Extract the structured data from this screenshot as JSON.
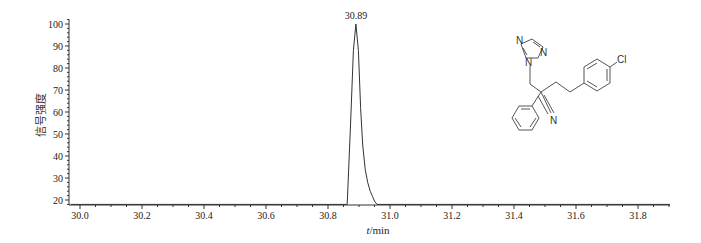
{
  "chart_data": {
    "type": "line",
    "title": "",
    "xlabel_var": "t",
    "xlabel_unit": "/min",
    "xlabel": "t/min",
    "ylabel": "信号强度",
    "xlim": [
      29.97,
      31.91
    ],
    "ylim": [
      18,
      102
    ],
    "x_ticks": [
      30.0,
      30.2,
      30.4,
      30.6,
      30.8,
      31.0,
      31.2,
      31.4,
      31.6,
      31.8
    ],
    "x_tick_labels": [
      "30.0",
      "30.2",
      "30.4",
      "30.6",
      "30.8",
      "31.0",
      "31.2",
      "31.4",
      "31.6",
      "31.8"
    ],
    "y_ticks": [
      20,
      30,
      40,
      50,
      60,
      70,
      80,
      90,
      100
    ],
    "y_tick_labels": [
      "20",
      "30",
      "40",
      "50",
      "60",
      "70",
      "80",
      "90",
      "100"
    ],
    "grid": false,
    "legend": null,
    "series": [
      {
        "name": "chromatogram",
        "x": [
          29.97,
          30.862,
          30.873,
          30.882,
          30.89,
          30.898,
          30.905,
          30.912,
          30.92,
          30.928,
          30.936,
          30.944,
          30.95,
          30.958,
          31.91
        ],
        "y": [
          18,
          18,
          55,
          88,
          100,
          88,
          62,
          45,
          34,
          28,
          24,
          21.5,
          19.5,
          18,
          18
        ]
      }
    ],
    "annotations": [
      {
        "text": "30.89",
        "x": 30.89,
        "y": 100,
        "type": "peak-label"
      }
    ],
    "inset": {
      "type": "chemical-structure",
      "compound": "fenbuconazole",
      "atom_labels": [
        "N",
        "N",
        "N",
        "N",
        "Cl"
      ]
    }
  }
}
